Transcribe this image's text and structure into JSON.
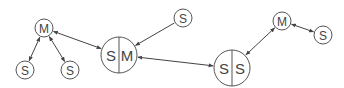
{
  "diagram": {
    "nodes": [
      {
        "id": "m1",
        "type": "single",
        "label": "M",
        "cx": 44,
        "cy": 28,
        "r": 9
      },
      {
        "id": "s1",
        "type": "single",
        "label": "S",
        "cx": 25,
        "cy": 70,
        "r": 9
      },
      {
        "id": "s2",
        "type": "single",
        "label": "S",
        "cx": 70,
        "cy": 70,
        "r": 9
      },
      {
        "id": "sm",
        "type": "split",
        "left": "S",
        "right": "M",
        "cx": 119,
        "cy": 55,
        "r": 18
      },
      {
        "id": "s3",
        "type": "single",
        "label": "S",
        "cx": 183,
        "cy": 18,
        "r": 9
      },
      {
        "id": "ss",
        "type": "split",
        "left": "S",
        "right": "S",
        "cx": 232,
        "cy": 68,
        "r": 18
      },
      {
        "id": "m2",
        "type": "single",
        "label": "M",
        "cx": 282,
        "cy": 21,
        "r": 9
      },
      {
        "id": "s4",
        "type": "single",
        "label": "S",
        "cx": 323,
        "cy": 35,
        "r": 9
      }
    ],
    "edges": [
      {
        "from": "m1",
        "to": "s1",
        "bidirectional": true
      },
      {
        "from": "m1",
        "to": "s2",
        "bidirectional": true
      },
      {
        "from": "m1",
        "to": "sm",
        "bidirectional": true
      },
      {
        "from": "s3",
        "to": "sm",
        "bidirectional": false
      },
      {
        "from": "ss",
        "to": "sm",
        "bidirectional": true
      },
      {
        "from": "ss",
        "to": "m2",
        "bidirectional": true
      },
      {
        "from": "m2",
        "to": "s4",
        "bidirectional": true
      }
    ],
    "colors": {
      "stroke": "#555555",
      "text": "#444444",
      "background": "#ffffff"
    }
  }
}
